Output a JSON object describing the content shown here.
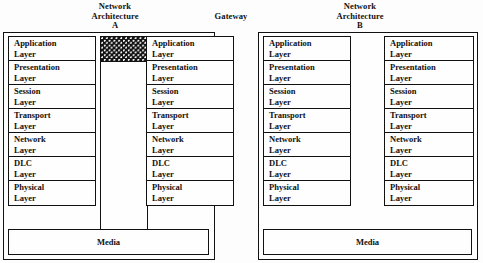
{
  "diagram": {
    "captions": {
      "architecture_a": {
        "line1": "Network",
        "line2": "Architecture",
        "line3": "A"
      },
      "gateway": {
        "line1": "Gateway"
      },
      "architecture_b": {
        "line1": "Network",
        "line2": "Architecture",
        "line3": "B"
      }
    },
    "layers": [
      {
        "name": "Application",
        "line1": "Application",
        "line2": "Layer"
      },
      {
        "name": "Presentation",
        "line1": "Presentation",
        "line2": "Layer"
      },
      {
        "name": "Session",
        "line1": "Session",
        "line2": "Layer"
      },
      {
        "name": "Transport",
        "line1": "Transport",
        "line2": "Layer"
      },
      {
        "name": "Network",
        "line1": "Network",
        "line2": "Layer"
      },
      {
        "name": "DLC",
        "line1": "DLC",
        "line2": "Layer"
      },
      {
        "name": "Physical",
        "line1": "Physical",
        "line2": "Layer"
      }
    ],
    "media": {
      "left_label": "Media",
      "right_label": "Media"
    },
    "gateway_block": {
      "fill": "checkerboard-dot-pattern",
      "label": ""
    },
    "colors": {
      "line": "#111111",
      "background": "#fdfdfd",
      "pattern_dark": "#121212",
      "pattern_light": "#ffffff"
    }
  }
}
